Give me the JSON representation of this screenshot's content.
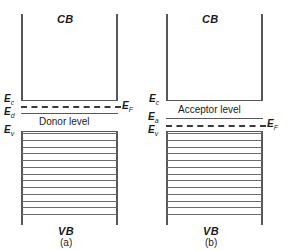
{
  "figure": {
    "line_color": "#58585a",
    "fill_line_color": "#6c6c6e",
    "text_color": "#1b1b1b",
    "background": "#ffffff"
  },
  "panels": [
    {
      "id": "a",
      "caption": "(a)",
      "conduction_band_label": "CB",
      "valence_band_label": "VB",
      "dopant_level_label": "Donor level",
      "levels": [
        {
          "name": "Ec",
          "symbol": "E",
          "subscript": "c",
          "style": "solid"
        },
        {
          "name": "Ed",
          "symbol": "E",
          "subscript": "d",
          "style": "solid"
        },
        {
          "name": "EF",
          "symbol": "E",
          "subscript": "F",
          "style": "dashed"
        },
        {
          "name": "Ev",
          "symbol": "E",
          "subscript": "v",
          "style": "solid"
        }
      ],
      "valence_band_fill_lines": 13
    },
    {
      "id": "b",
      "caption": "(b)",
      "conduction_band_label": "CB",
      "valence_band_label": "VB",
      "dopant_level_label": "Acceptor level",
      "levels": [
        {
          "name": "Ec",
          "symbol": "E",
          "subscript": "c",
          "style": "solid"
        },
        {
          "name": "Ea",
          "symbol": "E",
          "subscript": "a",
          "style": "solid"
        },
        {
          "name": "EF",
          "symbol": "E",
          "subscript": "F",
          "style": "dashed"
        },
        {
          "name": "Ev",
          "symbol": "E",
          "subscript": "v",
          "style": "solid"
        }
      ],
      "valence_band_fill_lines": 13
    }
  ],
  "chart_data": {
    "type": "diagram",
    "subplots": [
      {
        "label": "(a)",
        "bands": [
          "CB",
          "VB"
        ],
        "energy_levels": [
          "Ec",
          "Ed",
          "EF",
          "Ev"
        ],
        "annotations": [
          "Donor level"
        ],
        "note": "EF lies just below Ec and just above the donor level Ed"
      },
      {
        "label": "(b)",
        "bands": [
          "CB",
          "VB"
        ],
        "energy_levels": [
          "Ec",
          "Ea",
          "EF",
          "Ev"
        ],
        "annotations": [
          "Acceptor level"
        ],
        "note": "EF lies just below the acceptor level Ea and just above Ev"
      }
    ]
  }
}
